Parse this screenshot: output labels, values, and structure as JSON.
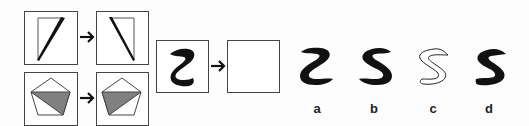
{
  "puzzle": {
    "type": "visual-analogy",
    "examples": [
      {
        "name": "triangle-example",
        "before": "thin triangle leaning right",
        "after": "thin triangle mirrored"
      },
      {
        "name": "pentagon-example",
        "before": "pentagon with shaded triangle on right",
        "after": "pentagon with shaded triangle mirrored"
      }
    ],
    "question": {
      "shape": "black squiggle Z shape",
      "answer_box": "empty"
    },
    "options": [
      {
        "label": "a",
        "style": "filled"
      },
      {
        "label": "b",
        "style": "filled"
      },
      {
        "label": "c",
        "style": "outline"
      },
      {
        "label": "d",
        "style": "filled"
      }
    ]
  },
  "colors": {
    "stroke": "#444444",
    "fill_black": "#111111",
    "fill_gray": "#808080",
    "background": "#fdfdfd"
  }
}
